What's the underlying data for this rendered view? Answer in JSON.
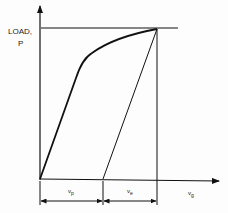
{
  "diagram": {
    "y_axis_label_line1": "LOAD,",
    "y_axis_label_line2": "P",
    "x_axis_label": "v",
    "x_axis_label_sub": "g",
    "segment_left_label": "v",
    "segment_left_sub": "p",
    "segment_right_label": "v",
    "segment_right_sub": "e",
    "colors": {
      "line": "#111111",
      "background": "#fdfdfd"
    }
  }
}
